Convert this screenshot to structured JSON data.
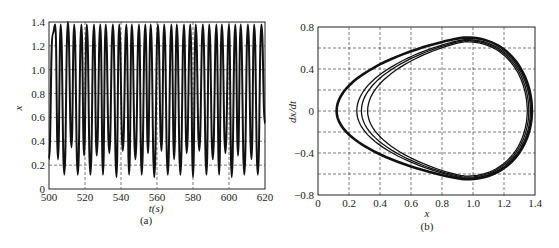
{
  "chart_data": [
    {
      "type": "line",
      "panel": "(a)",
      "xlabel": "t(s)",
      "ylabel": "x",
      "xlim": [
        500,
        620
      ],
      "ylim": [
        0,
        1.4
      ],
      "xticks": [
        "500",
        "520",
        "540",
        "560",
        "580",
        "600",
        "620"
      ],
      "yticks": [
        "0",
        "0.2",
        "0.4",
        "0.6",
        "0.8",
        "1.0",
        "1.2",
        "1.4"
      ],
      "grid": true,
      "description": "Quasi-periodic oscillation, peaks ~1.3-1.4, alternating troughs ~0.12 and ~0.25-0.35, period ~6.5 s",
      "x": [
        500,
        502,
        503.5,
        505,
        506.5,
        508.5,
        510.5,
        512.5,
        514,
        516,
        518,
        519.5,
        521,
        523,
        525,
        526.5,
        528.5,
        530,
        531.5,
        533.5,
        535.5,
        537.5,
        539,
        541,
        543,
        544.5,
        546,
        548,
        550,
        551.5,
        553.5,
        555,
        556.5,
        558.5,
        560.5,
        562.5,
        564,
        566,
        568,
        569.5,
        571,
        573,
        575,
        576.5,
        578.5,
        580,
        581.5,
        583.5,
        585.5,
        587.5,
        589,
        591,
        593,
        594.5,
        596,
        598,
        600,
        601.5,
        603.5,
        605,
        606.5,
        608.5,
        610.5,
        612.5,
        614,
        616,
        618,
        620
      ],
      "y": [
        0.25,
        1.3,
        1.38,
        0.25,
        1.38,
        0.12,
        1.4,
        0.35,
        1.38,
        0.12,
        1.38,
        0.28,
        1.38,
        0.12,
        1.38,
        0.28,
        1.38,
        0.12,
        1.38,
        0.3,
        1.38,
        0.1,
        1.38,
        0.32,
        1.38,
        0.12,
        1.38,
        0.25,
        1.38,
        0.12,
        1.38,
        0.3,
        1.38,
        0.1,
        1.38,
        0.32,
        1.38,
        0.12,
        1.38,
        0.25,
        1.38,
        0.12,
        1.38,
        0.3,
        1.38,
        0.1,
        1.38,
        0.32,
        1.38,
        0.12,
        1.38,
        0.25,
        1.38,
        0.12,
        1.38,
        0.3,
        1.38,
        0.1,
        1.38,
        0.28,
        1.38,
        0.12,
        1.38,
        0.25,
        1.38,
        0.12,
        1.38,
        0.55
      ]
    },
    {
      "type": "scatter",
      "panel": "(b)",
      "xlabel": "x",
      "ylabel": "dx/dt",
      "xlim": [
        0,
        1.4
      ],
      "ylim": [
        -0.8,
        0.8
      ],
      "xticks": [
        "0",
        "0.2",
        "0.4",
        "0.6",
        "0.8",
        "1.0",
        "1.2",
        "1.4"
      ],
      "yticks": [
        "-0.8",
        "-0.4",
        "0",
        "0.4",
        "0.8"
      ],
      "grid": true,
      "description": "Phase portrait: closed teardrop-shaped orbits; outer loop leftmost at x~0.12, inner loops leftmost at x~0.25-0.33; max dx/dt ~0.7 at x~0.95, min ~-0.65 at x~1.0, rightmost x~1.38",
      "orbits": [
        {
          "x_min": 0.12,
          "x_max": 1.38,
          "y_max": 0.7,
          "y_min": -0.65
        },
        {
          "x_min": 0.25,
          "x_max": 1.37,
          "y_max": 0.68,
          "y_min": -0.64
        },
        {
          "x_min": 0.28,
          "x_max": 1.36,
          "y_max": 0.67,
          "y_min": -0.63
        },
        {
          "x_min": 0.32,
          "x_max": 1.35,
          "y_max": 0.66,
          "y_min": -0.62
        }
      ]
    }
  ],
  "captions": {
    "a": "(a)",
    "b": "(b)"
  },
  "labels": {
    "a_x": "t(s)",
    "a_y": "x",
    "b_x": "x",
    "b_y": "dx/dt"
  }
}
